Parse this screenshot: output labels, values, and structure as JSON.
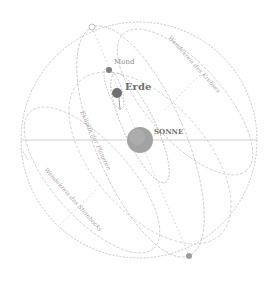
{
  "diagram": {
    "title": "",
    "labels": {
      "moon": "Mond",
      "earth": "Erde",
      "sun": "SONNE",
      "tropic_upper": "Wendekreis des Krebses",
      "ecliptic": "Ekliptik der Planeten",
      "tropic_lower": "Wendekreis des Steinbocks"
    },
    "bodies": [
      {
        "name": "sun",
        "label": "SONNE",
        "cx": 140,
        "cy": 140,
        "r": 13,
        "color": "#9a9a9a"
      },
      {
        "name": "earth",
        "label": "Erde",
        "cx": 117,
        "cy": 93,
        "r": 5,
        "color": "#6e6e6e"
      },
      {
        "name": "moon",
        "label": "Mond",
        "cx": 109,
        "cy": 70,
        "r": 3,
        "color": "#7a7a7a"
      },
      {
        "name": "pole-top",
        "label": "",
        "cx": 92,
        "cy": 27,
        "r": 3,
        "color": "#b0b0b0"
      },
      {
        "name": "pole-bottom",
        "label": "",
        "cx": 189,
        "cy": 256,
        "r": 3,
        "color": "#9a9a9a"
      }
    ],
    "colors": {
      "line": "#c4c4c4",
      "dashed": "#bdbdbd",
      "text": "#8a8a8a",
      "background": "#ffffff"
    }
  }
}
